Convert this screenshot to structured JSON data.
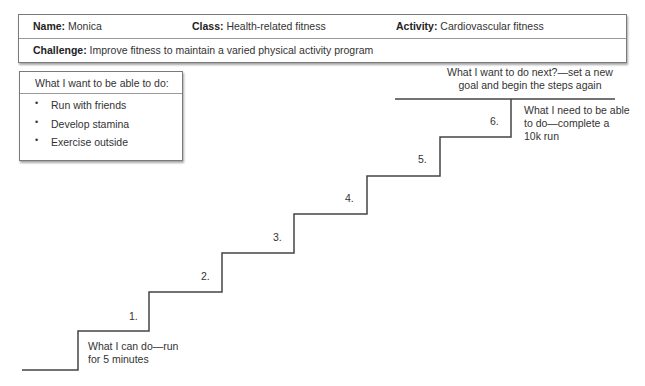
{
  "header": {
    "name_label": "Name:",
    "name_value": "Monica",
    "class_label": "Class:",
    "class_value": "Health-related fitness",
    "activity_label": "Activity:",
    "activity_value": "Cardiovascular fitness",
    "challenge_label": "Challenge:",
    "challenge_value": "Improve fitness to maintain a varied physical activity program"
  },
  "goals": {
    "title": "What I want to be able to do:",
    "items": [
      "Run with friends",
      "Develop stamina",
      "Exercise outside"
    ],
    "bullet": "•"
  },
  "staircase": {
    "start_label_line1": "What I can do—run",
    "start_label_line2": "for 5 minutes",
    "end_label_line1": "What I need to be able",
    "end_label_line2": "to do—complete a",
    "end_label_line3": "10k run",
    "next_label_line1": "What I want to do next?—set a new",
    "next_label_line2": "goal and begin the steps again",
    "steps": [
      "1.",
      "2.",
      "3.",
      "4.",
      "5.",
      "6."
    ],
    "line_color": "#444444"
  }
}
